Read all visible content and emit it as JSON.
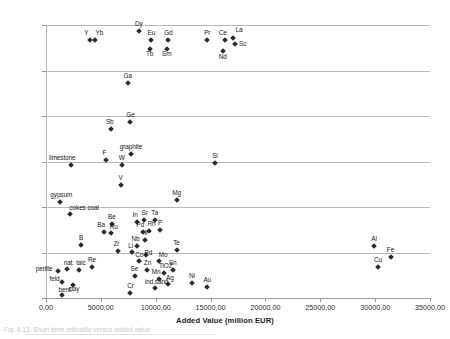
{
  "figure": {
    "caption": "Fig. 4.13.  Short term criticality versus added value",
    "background": "#ffffff",
    "point_color": "#2b2b2b",
    "grid_color": "#b9b9b9"
  },
  "chart_data": {
    "type": "scatter",
    "title": "",
    "xlabel": "Added Value (million EUR)",
    "ylabel": "short term criticality",
    "xlim": [
      0,
      35000
    ],
    "ylim": [
      0,
      1.2
    ],
    "grid": true,
    "legend": "none",
    "xticks": [
      "0,00",
      "5000,00",
      "10000,00",
      "15000,00",
      "20000,00",
      "25000,00",
      "30000,00",
      "35000,00"
    ],
    "xtick_values": [
      0,
      5000,
      10000,
      15000,
      20000,
      25000,
      30000,
      35000
    ],
    "yticks": [
      "0,00",
      "0,20",
      "0,40",
      "0,60",
      "0,80",
      "1,00",
      "1,20"
    ],
    "ytick_values": [
      0,
      0.2,
      0.4,
      0.6,
      0.8,
      1.0,
      1.2
    ],
    "points": [
      {
        "label": "Y",
        "x": 4050,
        "y": 1.135,
        "lx": -4,
        "ly": -4
      },
      {
        "label": "Yb",
        "x": 4500,
        "y": 1.135,
        "lx": 4,
        "ly": -4
      },
      {
        "label": "Dy",
        "x": 8450,
        "y": 1.175,
        "lx": 0,
        "ly": -4
      },
      {
        "label": "Eu",
        "x": 9600,
        "y": 1.135,
        "lx": 0,
        "ly": -4
      },
      {
        "label": "Gd",
        "x": 11150,
        "y": 1.135,
        "lx": 0,
        "ly": -4
      },
      {
        "label": "Tb",
        "x": 9450,
        "y": 1.095,
        "lx": 0,
        "ly": 8
      },
      {
        "label": "Sm",
        "x": 11000,
        "y": 1.095,
        "lx": 0,
        "ly": 8
      },
      {
        "label": "Pr",
        "x": 14700,
        "y": 1.135,
        "lx": 0,
        "ly": -4
      },
      {
        "label": "Ce",
        "x": 16300,
        "y": 1.135,
        "lx": -2,
        "ly": -4
      },
      {
        "label": "La",
        "x": 17050,
        "y": 1.145,
        "lx": 6,
        "ly": -5
      },
      {
        "label": "Sc",
        "x": 17200,
        "y": 1.118,
        "lx": 8,
        "ly": 3
      },
      {
        "label": "Nd",
        "x": 16100,
        "y": 1.085,
        "lx": 0,
        "ly": 9
      },
      {
        "label": "Ga",
        "x": 7450,
        "y": 0.945,
        "lx": 0,
        "ly": -4
      },
      {
        "label": "Ge",
        "x": 7700,
        "y": 0.775,
        "lx": 0,
        "ly": -4
      },
      {
        "label": "Sb",
        "x": 5900,
        "y": 0.742,
        "lx": -1,
        "ly": -4
      },
      {
        "label": "graphite",
        "x": 7750,
        "y": 0.635,
        "lx": 0,
        "ly": -4
      },
      {
        "label": "F",
        "x": 5500,
        "y": 0.607,
        "lx": -2,
        "ly": -4
      },
      {
        "label": "limestone",
        "x": 2300,
        "y": 0.585,
        "lx": -9,
        "ly": -4
      },
      {
        "label": "W",
        "x": 6900,
        "y": 0.585,
        "lx": 0,
        "ly": -4
      },
      {
        "label": "Si",
        "x": 15400,
        "y": 0.592,
        "lx": 0,
        "ly": -4
      },
      {
        "label": "V",
        "x": 6800,
        "y": 0.495,
        "lx": 0,
        "ly": -4
      },
      {
        "label": "gypsum",
        "x": 1300,
        "y": 0.423,
        "lx": 1,
        "ly": -4
      },
      {
        "label": "Mg",
        "x": 11900,
        "y": 0.432,
        "lx": 0,
        "ly": -4
      },
      {
        "label": "cokes coal",
        "x": 2200,
        "y": 0.368,
        "lx": 14,
        "ly": -3
      },
      {
        "label": "Be",
        "x": 6000,
        "y": 0.325,
        "lx": 0,
        "ly": -4
      },
      {
        "label": "In",
        "x": 8300,
        "y": 0.333,
        "lx": -2,
        "ly": -4
      },
      {
        "label": "Sr",
        "x": 8900,
        "y": 0.345,
        "lx": 1,
        "ly": -4
      },
      {
        "label": "Ta",
        "x": 9900,
        "y": 0.345,
        "lx": 0,
        "ly": -4
      },
      {
        "label": "Ba",
        "x": 5300,
        "y": 0.292,
        "lx": -3,
        "ly": -4
      },
      {
        "label": "Ru",
        "x": 5900,
        "y": 0.285,
        "lx": 3,
        "ly": -3
      },
      {
        "label": "Pd",
        "x": 8850,
        "y": 0.29,
        "lx": -3,
        "ly": -4
      },
      {
        "label": "Rh",
        "x": 9350,
        "y": 0.295,
        "lx": 3,
        "ly": -4
      },
      {
        "label": "P",
        "x": 10400,
        "y": 0.3,
        "lx": 0,
        "ly": -4
      },
      {
        "label": "Ir",
        "x": 9050,
        "y": 0.255,
        "lx": 1,
        "ly": -4
      },
      {
        "label": "Nb",
        "x": 8250,
        "y": 0.228,
        "lx": -1,
        "ly": -4
      },
      {
        "label": "Zr",
        "x": 6600,
        "y": 0.207,
        "lx": -2,
        "ly": -4
      },
      {
        "label": "Li",
        "x": 7800,
        "y": 0.203,
        "lx": -1,
        "ly": -3
      },
      {
        "label": "Te",
        "x": 11900,
        "y": 0.21,
        "lx": 0,
        "ly": -4
      },
      {
        "label": "Pd",
        "x": 9150,
        "y": 0.19,
        "lx": 2,
        "ly": 1
      },
      {
        "label": "Co",
        "x": 8500,
        "y": 0.162,
        "lx": 0,
        "ly": -3
      },
      {
        "label": "Mo",
        "x": 10300,
        "y": 0.163,
        "lx": 4,
        "ly": -3
      },
      {
        "label": "Zn",
        "x": 9250,
        "y": 0.125,
        "lx": 0,
        "ly": -4
      },
      {
        "label": "Sn",
        "x": 11550,
        "y": 0.122,
        "lx": 0,
        "ly": -4
      },
      {
        "label": "TiO2",
        "x": 10800,
        "y": 0.11,
        "lx": 1,
        "ly": -4
      },
      {
        "label": "Se",
        "x": 8150,
        "y": 0.095,
        "lx": -1,
        "ly": -4
      },
      {
        "label": "Mn",
        "x": 10300,
        "y": 0.083,
        "lx": -3,
        "ly": -4
      },
      {
        "label": "Ag",
        "x": 11100,
        "y": 0.062,
        "lx": 2,
        "ly": -3
      },
      {
        "label": "Ni",
        "x": 13300,
        "y": 0.065,
        "lx": 0,
        "ly": -4
      },
      {
        "label": "Au",
        "x": 14700,
        "y": 0.05,
        "lx": 0,
        "ly": -4
      },
      {
        "label": "ind.sand",
        "x": 9900,
        "y": 0.042,
        "lx": 2,
        "ly": -3
      },
      {
        "label": "Cr",
        "x": 7700,
        "y": 0.02,
        "lx": 0,
        "ly": -4
      },
      {
        "label": "perlite",
        "x": 1100,
        "y": 0.118,
        "lx": -14,
        "ly": 1
      },
      {
        "label": "nat.",
        "x": 1900,
        "y": 0.128,
        "lx": 2,
        "ly": -3
      },
      {
        "label": "talc",
        "x": 3000,
        "y": 0.122,
        "lx": 2,
        "ly": -4
      },
      {
        "label": "Re",
        "x": 4200,
        "y": 0.135,
        "lx": 0,
        "ly": -4
      },
      {
        "label": "feld",
        "x": 1500,
        "y": 0.072,
        "lx": -8,
        "ly": 0
      },
      {
        "label": "clay",
        "x": 2450,
        "y": 0.055,
        "lx": 1,
        "ly": 7
      },
      {
        "label": "bent.",
        "x": 1500,
        "y": 0.012,
        "lx": 3,
        "ly": -2
      },
      {
        "label": "B",
        "x": 3200,
        "y": 0.232,
        "lx": 0,
        "ly": -4
      },
      {
        "label": "Al",
        "x": 29900,
        "y": 0.23,
        "lx": 0,
        "ly": -4
      },
      {
        "label": "Fe",
        "x": 31400,
        "y": 0.182,
        "lx": 0,
        "ly": -4
      },
      {
        "label": "Cu",
        "x": 30250,
        "y": 0.135,
        "lx": 0,
        "ly": -4
      }
    ]
  }
}
